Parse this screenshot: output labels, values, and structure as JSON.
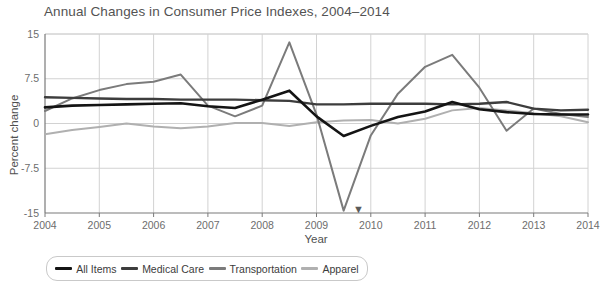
{
  "chart_data": {
    "type": "line",
    "title": "Annual Changes in Consumer Price Indexes, 2004–2014",
    "xlabel": "Year",
    "ylabel": "Percent change",
    "xlim": [
      2004,
      2014
    ],
    "ylim": [
      -15,
      15
    ],
    "xticks": [
      "2004",
      "2005",
      "2006",
      "2007",
      "2008",
      "2009",
      "2010",
      "2011",
      "2012",
      "2013",
      "2014"
    ],
    "yticks": [
      "15",
      "7.5",
      "0",
      "-7.5",
      "-15"
    ],
    "ytick_values": [
      15,
      7.5,
      0,
      -7.5,
      -15
    ],
    "grid": true,
    "legend_position": "bottom",
    "x": [
      2004,
      2004.5,
      2005,
      2005.5,
      2006,
      2006.5,
      2007,
      2007.5,
      2008,
      2008.5,
      2009,
      2009.5,
      2010,
      2010.5,
      2011,
      2011.5,
      2012,
      2012.5,
      2013,
      2013.5,
      2014
    ],
    "series": [
      {
        "name": "All Items",
        "color": "#141414",
        "values": [
          2.7,
          3.0,
          3.1,
          3.2,
          3.3,
          3.4,
          2.9,
          2.6,
          4.0,
          5.5,
          1.2,
          -2.1,
          -0.4,
          1.1,
          2.0,
          3.6,
          2.4,
          1.9,
          1.6,
          1.5,
          1.5
        ]
      },
      {
        "name": "Medical Care",
        "color": "#3d3d3d",
        "values": [
          4.4,
          4.3,
          4.2,
          4.1,
          4.1,
          4.0,
          4.0,
          4.0,
          3.9,
          3.8,
          3.2,
          3.2,
          3.3,
          3.3,
          3.3,
          3.2,
          3.3,
          3.6,
          2.5,
          2.2,
          2.3
        ]
      },
      {
        "name": "Transportation",
        "color": "#7b7b7b",
        "values": [
          2.1,
          4.2,
          5.6,
          6.6,
          7.0,
          8.2,
          3.0,
          1.2,
          3.0,
          13.6,
          1.5,
          -14.6,
          -2.0,
          5.0,
          9.5,
          11.5,
          6.0,
          -1.2,
          2.5,
          1.6,
          1.1
        ]
      },
      {
        "name": "Apparel",
        "color": "#b0b0b0",
        "values": [
          -1.8,
          -1.1,
          -0.6,
          0.0,
          -0.5,
          -0.8,
          -0.5,
          0.1,
          0.1,
          -0.4,
          0.2,
          0.5,
          0.6,
          0.0,
          0.8,
          2.2,
          2.6,
          2.2,
          1.7,
          1.2,
          0.2
        ]
      }
    ]
  },
  "axis": {
    "y_title": "Percent change",
    "x_title": "Year"
  },
  "legend": {
    "items": [
      {
        "label": "All Items",
        "color": "#141414"
      },
      {
        "label": "Medical Care",
        "color": "#3d3d3d"
      },
      {
        "label": "Transportation",
        "color": "#7b7b7b"
      },
      {
        "label": "Apparel",
        "color": "#b0b0b0"
      }
    ]
  },
  "cursor": {
    "glyph": "▼"
  }
}
